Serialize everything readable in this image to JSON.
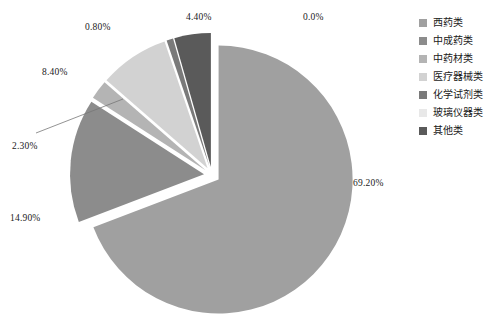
{
  "chart_data": {
    "type": "pie",
    "title": "",
    "categories": [
      "西药类",
      "中成药类",
      "中药材类",
      "医疗器械类",
      "化学试剂类",
      "玻璃仪器类",
      "其他类"
    ],
    "values": [
      69.2,
      14.9,
      2.3,
      8.4,
      0.8,
      0.0,
      4.4
    ],
    "value_labels": [
      "69.20%",
      "14.90%",
      "2.30%",
      "8.40%",
      "0.80%",
      "0.0%",
      "4.40%"
    ],
    "colors": [
      "#a0a0a0",
      "#8c8c8c",
      "#b4b4b4",
      "#d2d2d2",
      "#7a7a7a",
      "#e8e8e8",
      "#5a5a5a"
    ],
    "legend_position": "right",
    "exploded": true,
    "start_angle_deg": 90,
    "direction": "clockwise",
    "grid": false
  },
  "legend": {
    "items": [
      {
        "label": "西药类",
        "color": "#a0a0a0"
      },
      {
        "label": "中成药类",
        "color": "#8c8c8c"
      },
      {
        "label": "中药材类",
        "color": "#b4b4b4"
      },
      {
        "label": "医疗器械类",
        "color": "#d2d2d2"
      },
      {
        "label": "化学试剂类",
        "color": "#7a7a7a"
      },
      {
        "label": "玻璃仪器类",
        "color": "#e8e8e8"
      },
      {
        "label": "其他类",
        "color": "#5a5a5a"
      }
    ]
  },
  "labels": {
    "xiyao": "69.20%",
    "zhongchengyao": "14.90%",
    "zhongyaocai": "2.30%",
    "yiliaoqixie": "8.40%",
    "huaxueshiji": "0.80%",
    "boliyiqi": "0.0%",
    "qita": "4.40%"
  }
}
